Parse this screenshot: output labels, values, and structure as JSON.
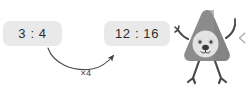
{
  "scene": {
    "title": "Equivalent ratio scaling illustration",
    "background_color": "#ffffff"
  },
  "ratio_from": {
    "name": "original-ratio",
    "text": "3 : 4",
    "antecedent": 3,
    "consequent": 4,
    "box_color": "#e9e9e9",
    "text_color": "#2e2e2e"
  },
  "ratio_to": {
    "name": "scaled-ratio",
    "text": "12 : 16",
    "antecedent": 12,
    "consequent": 16,
    "box_color": "#e9e9e9",
    "text_color": "#2e2e2e"
  },
  "transform": {
    "label": "×4",
    "factor": 4,
    "arrow_color": "#4a4a4a",
    "direction": "left-to-right"
  },
  "mascot": {
    "name": "triangle-character",
    "body_color": "#8c8c8c",
    "body_shadow_color": "#6f6f6f",
    "face_color": "#e3e3e3",
    "eye_color": "#4a4a4a",
    "nose_color": "#3a3a3a",
    "limb_color": "#4a4a4a",
    "pose": "one-arm-raised-pointing"
  },
  "edge_mark": {
    "name": "cropped-edge-glyph",
    "glyph": "<",
    "color": "#9a9a9a"
  }
}
